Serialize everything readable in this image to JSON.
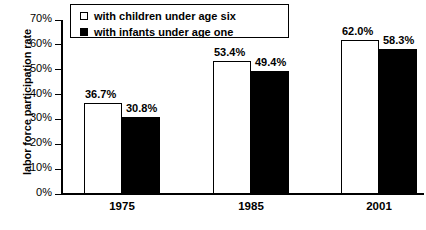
{
  "chart_data": {
    "type": "bar",
    "title": "",
    "xlabel": "",
    "ylabel": "labor force participation rate",
    "categories": [
      "1975",
      "1985",
      "2001"
    ],
    "series": [
      {
        "name": "with children under age six",
        "swatch": "light",
        "color": "#ffffff",
        "values": [
          36.7,
          53.4,
          62.0
        ],
        "labels": [
          "36.7%",
          "53.4%",
          "62.0%"
        ]
      },
      {
        "name": "with infants under age one",
        "swatch": "dark",
        "color": "#000000",
        "values": [
          30.8,
          49.4,
          58.3
        ],
        "labels": [
          "30.8%",
          "49.4%",
          "58.3%"
        ]
      }
    ],
    "ylim": [
      0,
      70
    ],
    "ytick_values": [
      70,
      60,
      50,
      40,
      30,
      20,
      10,
      0
    ],
    "ytick_labels": [
      "70%",
      "60%",
      "50%",
      "40%",
      "30%",
      "20%",
      "10%",
      "0%"
    ],
    "grid": false,
    "legend_position": "top-left-inside",
    "axis_color": "#000000"
  },
  "legend": {
    "items": [
      {
        "label": "with children under age six",
        "swatch": "light"
      },
      {
        "label": "with infants under age one",
        "swatch": "dark"
      }
    ]
  },
  "yaxis": {
    "title": "labor force participation rate",
    "ticks": [
      {
        "label": "70%",
        "value": 70
      },
      {
        "label": "60%",
        "value": 60
      },
      {
        "label": "50%",
        "value": 50
      },
      {
        "label": "40%",
        "value": 40
      },
      {
        "label": "30%",
        "value": 30
      },
      {
        "label": "20%",
        "value": 20
      },
      {
        "label": "10%",
        "value": 10
      },
      {
        "label": "0%",
        "value": 0
      }
    ]
  },
  "xaxis": {
    "categories": [
      "1975",
      "1985",
      "2001"
    ]
  },
  "bars": [
    {
      "group": "1975",
      "series": "with children under age six",
      "value": 36.7,
      "label": "36.7%",
      "style": "light"
    },
    {
      "group": "1975",
      "series": "with infants under age one",
      "value": 30.8,
      "label": "30.8%",
      "style": "dark"
    },
    {
      "group": "1985",
      "series": "with children under age six",
      "value": 53.4,
      "label": "53.4%",
      "style": "light"
    },
    {
      "group": "1985",
      "series": "with infants under age one",
      "value": 49.4,
      "label": "49.4%",
      "style": "dark"
    },
    {
      "group": "2001",
      "series": "with children under age six",
      "value": 62.0,
      "label": "62.0%",
      "style": "light"
    },
    {
      "group": "2001",
      "series": "with infants under age one",
      "value": 58.3,
      "label": "58.3%",
      "style": "dark"
    }
  ]
}
